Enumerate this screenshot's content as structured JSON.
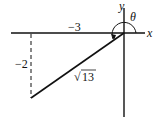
{
  "diagram": {
    "axes": {
      "x_label": "x",
      "y_label": "y"
    },
    "angle_label": "θ",
    "horizontal_leg_label": "−3",
    "vertical_leg_label": "−2",
    "hypotenuse_label": "13",
    "hypotenuse_radical": "√",
    "colors": {
      "stroke": "#111111",
      "background": "#ffffff"
    }
  }
}
